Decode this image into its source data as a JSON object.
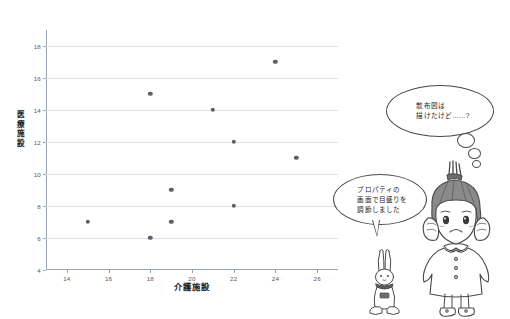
{
  "chart_data": {
    "type": "scatter",
    "title": "",
    "xlabel": "介護施設",
    "ylabel": "医療施設",
    "xlim": [
      13,
      27
    ],
    "ylim": [
      4,
      19
    ],
    "grid": true,
    "legend": "none",
    "xticks": [
      "14",
      "16",
      "18",
      "20",
      "22",
      "24",
      "26"
    ],
    "xtick_values": [
      14,
      16,
      18,
      20,
      22,
      24,
      26
    ],
    "yticks": [
      "4",
      "6",
      "8",
      "10",
      "12",
      "14",
      "16",
      "18"
    ],
    "ytick_values": [
      4,
      6,
      8,
      10,
      12,
      14,
      16,
      18
    ],
    "series": [
      {
        "name": "施設数",
        "marker_color": "#5a5f68",
        "points": [
          {
            "x": 15,
            "y": 7
          },
          {
            "x": 18,
            "y": 15
          },
          {
            "x": 18,
            "y": 6
          },
          {
            "x": 19,
            "y": 9
          },
          {
            "x": 19,
            "y": 7
          },
          {
            "x": 21,
            "y": 14
          },
          {
            "x": 22,
            "y": 12
          },
          {
            "x": 22,
            "y": 8
          },
          {
            "x": 24,
            "y": 17
          },
          {
            "x": 25,
            "y": 11
          }
        ]
      }
    ]
  },
  "annotations": {
    "thought_bubble": "散布図は\n描けたけど……?",
    "speech_bubble": "プロパティの\n画面で目盛りを\n調節しました"
  },
  "characters": {
    "girl": "girl-character",
    "rabbit": "rabbit-character"
  },
  "colors": {
    "marker": "#5a5f68",
    "gridline": "#dfe3e8",
    "axis": "#9aa3b0",
    "tick_label": "#55595e",
    "title_text": "#1c1c1c",
    "outline": "#4a4a4a",
    "background": "#ffffff"
  }
}
